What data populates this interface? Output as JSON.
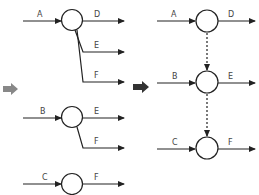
{
  "diagram": {
    "left_group": {
      "node1": {
        "inputs": [
          "A"
        ],
        "outputs": [
          "D",
          "E",
          "F"
        ]
      },
      "node2": {
        "inputs": [
          "B"
        ],
        "outputs": [
          "E",
          "F"
        ]
      },
      "node3": {
        "inputs": [
          "C"
        ],
        "outputs": [
          "F"
        ]
      }
    },
    "right_group": {
      "node1": {
        "input": "A",
        "output": "D"
      },
      "node2": {
        "input": "B",
        "output": "E"
      },
      "node3": {
        "input": "C",
        "output": "F"
      }
    },
    "labels": {
      "l1_in": "A",
      "l1_d": "D",
      "l1_e": "E",
      "l1_f": "F",
      "l2_in": "B",
      "l2_e": "E",
      "l2_f": "F",
      "l3_in": "C",
      "l3_f": "F",
      "r1_in": "A",
      "r1_out": "D",
      "r2_in": "B",
      "r2_out": "E",
      "r3_in": "C",
      "r3_out": "F"
    },
    "colors": {
      "line": "#222222",
      "left_block_arrow": "#888888",
      "right_block_arrow": "#333333"
    }
  }
}
